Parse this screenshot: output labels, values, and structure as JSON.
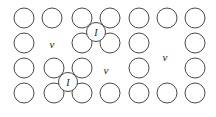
{
  "figure": {
    "width": 216,
    "height": 117,
    "background_color": "#ffffff",
    "atom_stroke_color": "#4a4a4a",
    "label_color": "#1a1a1a",
    "atom_radius": 10,
    "interstitial_radius": 9.5,
    "lattice": {
      "columns": 7,
      "rows": 4,
      "column_spacing": 28,
      "row_spacing": 25,
      "origin_x": 24,
      "origin_y": 18
    }
  },
  "atoms": [
    {
      "id": "atom-r1c1",
      "row": 1,
      "col": 1,
      "cx": 24,
      "cy": 18,
      "r": 10
    },
    {
      "id": "atom-r1c2",
      "row": 1,
      "col": 2,
      "cx": 52,
      "cy": 18,
      "r": 10
    },
    {
      "id": "atom-r1c3",
      "row": 1,
      "col": 3,
      "cx": 82,
      "cy": 18,
      "r": 10
    },
    {
      "id": "atom-r1c4",
      "row": 1,
      "col": 4,
      "cx": 110,
      "cy": 18,
      "r": 10
    },
    {
      "id": "atom-r1c5",
      "row": 1,
      "col": 5,
      "cx": 139,
      "cy": 18,
      "r": 10
    },
    {
      "id": "atom-r1c6",
      "row": 1,
      "col": 6,
      "cx": 167,
      "cy": 18,
      "r": 10
    },
    {
      "id": "atom-r1c7",
      "row": 1,
      "col": 7,
      "cx": 195,
      "cy": 18,
      "r": 10
    },
    {
      "id": "atom-r2c1",
      "row": 2,
      "col": 1,
      "cx": 24,
      "cy": 43,
      "r": 10
    },
    {
      "id": "atom-r2c3",
      "row": 2,
      "col": 3,
      "cx": 82,
      "cy": 43,
      "r": 10
    },
    {
      "id": "atom-r2c4",
      "row": 2,
      "col": 4,
      "cx": 110,
      "cy": 43,
      "r": 10
    },
    {
      "id": "atom-r2c5",
      "row": 2,
      "col": 5,
      "cx": 139,
      "cy": 43,
      "r": 10
    },
    {
      "id": "atom-r2c7",
      "row": 2,
      "col": 7,
      "cx": 195,
      "cy": 43,
      "r": 10
    },
    {
      "id": "atom-r3c1",
      "row": 3,
      "col": 1,
      "cx": 24,
      "cy": 68,
      "r": 10
    },
    {
      "id": "atom-r3c2",
      "row": 3,
      "col": 2,
      "cx": 54,
      "cy": 68,
      "r": 10
    },
    {
      "id": "atom-r3c3",
      "row": 3,
      "col": 3,
      "cx": 82,
      "cy": 68,
      "r": 10
    },
    {
      "id": "atom-r3c5",
      "row": 3,
      "col": 5,
      "cx": 139,
      "cy": 68,
      "r": 10
    },
    {
      "id": "atom-r3c7",
      "row": 3,
      "col": 7,
      "cx": 195,
      "cy": 68,
      "r": 10
    },
    {
      "id": "atom-r4c1",
      "row": 4,
      "col": 1,
      "cx": 24,
      "cy": 93,
      "r": 10
    },
    {
      "id": "atom-r4c2",
      "row": 4,
      "col": 2,
      "cx": 54,
      "cy": 93,
      "r": 10
    },
    {
      "id": "atom-r4c3",
      "row": 4,
      "col": 3,
      "cx": 82,
      "cy": 93,
      "r": 10
    },
    {
      "id": "atom-r4c4",
      "row": 4,
      "col": 4,
      "cx": 110,
      "cy": 93,
      "r": 10
    },
    {
      "id": "atom-r4c5",
      "row": 4,
      "col": 5,
      "cx": 139,
      "cy": 93,
      "r": 10
    },
    {
      "id": "atom-r4c6",
      "row": 4,
      "col": 6,
      "cx": 167,
      "cy": 93,
      "r": 10
    },
    {
      "id": "atom-r4c7",
      "row": 4,
      "col": 7,
      "cx": 195,
      "cy": 93,
      "r": 10
    }
  ],
  "interstitials": [
    {
      "id": "interstitial-upper",
      "label": "I",
      "cx": 96,
      "cy": 32,
      "r": 9.5
    },
    {
      "id": "interstitial-lower",
      "label": "I",
      "cx": 68,
      "cy": 82,
      "r": 9.5
    }
  ],
  "vacancies": [
    {
      "id": "vacancy-r2c2",
      "label": "v",
      "cx": 52,
      "cy": 44
    },
    {
      "id": "vacancy-r3c4",
      "label": "v",
      "cx": 106,
      "cy": 70
    },
    {
      "id": "vacancy-r23c6",
      "label": "v",
      "cx": 165,
      "cy": 57
    }
  ]
}
